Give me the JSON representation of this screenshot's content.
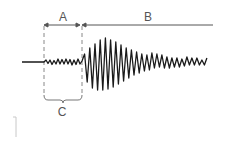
{
  "diagram": {
    "type": "seismogram",
    "labels": {
      "a": "A",
      "b": "B",
      "c": "C"
    },
    "colors": {
      "waveform": "#1a1a1a",
      "annotation": "#555555",
      "dashed": "#888888",
      "corner_mark": "#c8c8c8"
    },
    "regions": [
      {
        "id": "A",
        "description": "interval from first arrival to second arrival (double-headed arrow)"
      },
      {
        "id": "B",
        "description": "interval from second arrival onward (line extending right)"
      },
      {
        "id": "C",
        "description": "bracket under the small-amplitude segment between dashed lines"
      }
    ]
  }
}
